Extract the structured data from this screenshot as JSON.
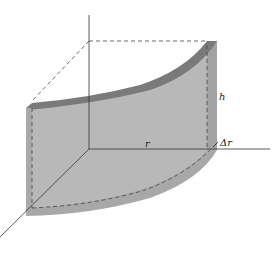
{
  "figure": {
    "labels": {
      "height": "h",
      "radius": "r",
      "thickness": "Δr"
    },
    "colors": {
      "shell_face": "#b4b4b4",
      "shell_top": "#7e7e7e",
      "shell_side": "#9a9a9a",
      "axis": "#333333",
      "dashed": "#444444",
      "background": "#ffffff"
    }
  }
}
